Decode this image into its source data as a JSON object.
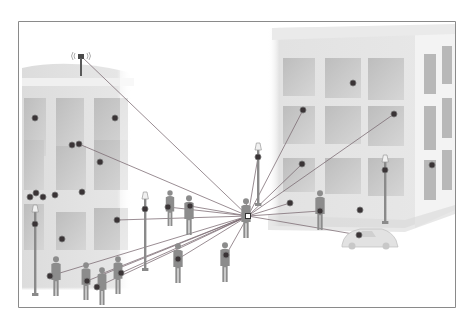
{
  "diagram": {
    "colors": {
      "background": "#ffffff",
      "frame": "#8a8a8a",
      "building_face": "#e4e4e4",
      "building_side": "#f2f2f2",
      "window": "#c9c9c9",
      "silhouette": "#8c8c8c",
      "line": "#7a6a72",
      "node_fill": "#3a3436",
      "node_ring": "#7a7a7a"
    },
    "hub": {
      "name": "central-hub",
      "icon": "person-hub-icon"
    },
    "antenna": {
      "name": "cell-tower",
      "icon": "antenna-icon"
    },
    "connected_nodes": [
      "antenna",
      "left-building-window-node",
      "left-building-window-node-2",
      "left-street-lamp-node",
      "left-pedestrian-node",
      "left-pedestrian-node-2",
      "center-pedestrian-node",
      "center-pedestrian-node-2",
      "center-pedestrian-node-3",
      "right-building-window-node",
      "right-building-window-node-2",
      "right-building-window-node-3",
      "right-street-lamp-node",
      "right-pedestrian-node",
      "right-small-node",
      "car-node"
    ],
    "unconnected_nodes_count": 16
  }
}
